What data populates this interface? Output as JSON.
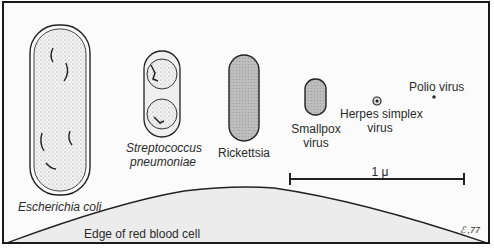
{
  "diagram": {
    "organisms": [
      {
        "id": "ecoli",
        "label": "Escherichia coli",
        "italic": true
      },
      {
        "id": "strep",
        "label_line1": "Streptococcus",
        "label_line2": "pneumoniae",
        "italic": true
      },
      {
        "id": "rickettsia",
        "label": "Rickettsia",
        "italic": false
      },
      {
        "id": "smallpox",
        "label_line1": "Smallpox",
        "label_line2": "virus",
        "italic": false
      },
      {
        "id": "herpes",
        "label_line1": "Herpes simplex",
        "label_line2": "virus",
        "italic": false
      },
      {
        "id": "polio",
        "label": "Polio virus",
        "italic": false
      }
    ],
    "scale_bar": {
      "label": "1 μ"
    },
    "rbc_label": "Edge of red blood cell",
    "signature": "ℰ ,77",
    "colors": {
      "outline": "#1a1a1a",
      "fill_gray": "#b8b8b8",
      "rbc_fill": "#ececec",
      "background": "#fbfbfb"
    }
  }
}
